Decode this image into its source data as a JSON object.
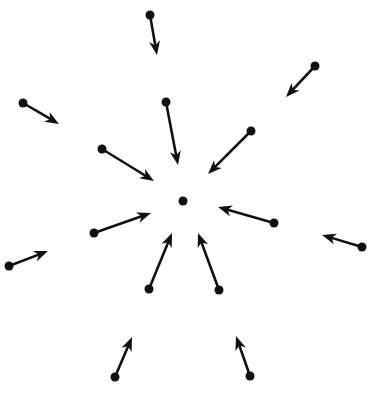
{
  "diagram": {
    "title": "",
    "stroke_color": "#111111",
    "background": "#ffffff",
    "center": {
      "x": 183,
      "y": 201,
      "r": 4.5
    },
    "arrows": [
      {
        "id": "top",
        "x1": 150,
        "y1": 15,
        "x2": 157,
        "y2": 55
      },
      {
        "id": "top-right-far",
        "x1": 315,
        "y1": 66,
        "x2": 286,
        "y2": 97
      },
      {
        "id": "left-upper-far",
        "x1": 23,
        "y1": 103,
        "x2": 59,
        "y2": 124
      },
      {
        "id": "inner-top",
        "x1": 166,
        "y1": 102,
        "x2": 178,
        "y2": 165
      },
      {
        "id": "inner-upper-left",
        "x1": 102,
        "y1": 149,
        "x2": 154,
        "y2": 181
      },
      {
        "id": "inner-upper-right",
        "x1": 251,
        "y1": 131,
        "x2": 208,
        "y2": 174
      },
      {
        "id": "inner-right",
        "x1": 274,
        "y1": 223,
        "x2": 218,
        "y2": 207
      },
      {
        "id": "right-far",
        "x1": 362,
        "y1": 247,
        "x2": 322,
        "y2": 235
      },
      {
        "id": "inner-left",
        "x1": 94,
        "y1": 233,
        "x2": 151,
        "y2": 213
      },
      {
        "id": "left-far",
        "x1": 9,
        "y1": 266,
        "x2": 48,
        "y2": 251
      },
      {
        "id": "inner-lower-left",
        "x1": 149,
        "y1": 289,
        "x2": 172,
        "y2": 233
      },
      {
        "id": "inner-lower-right",
        "x1": 219,
        "y1": 290,
        "x2": 198,
        "y2": 233
      },
      {
        "id": "bottom-left",
        "x1": 115,
        "y1": 377,
        "x2": 132,
        "y2": 337
      },
      {
        "id": "bottom-right",
        "x1": 250,
        "y1": 376,
        "x2": 236,
        "y2": 336
      }
    ]
  }
}
